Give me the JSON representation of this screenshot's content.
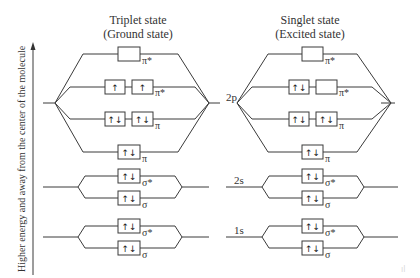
{
  "axis": {
    "label": "Higher energy and away from the center of the molecule"
  },
  "panels": [
    {
      "id": "triplet",
      "title_line1": "Triplet state",
      "title_line2": "(Ground state)",
      "orbitals": {
        "pi_star_top": {
          "label": "π*",
          "boxes": [
            ""
          ]
        },
        "pi_star_pair": {
          "label": "π*",
          "boxes": [
            "↑",
            "↑"
          ]
        },
        "pi_pair": {
          "label": "π",
          "boxes": [
            "↑↓",
            "↑↓"
          ]
        },
        "pi_low": {
          "label": "π",
          "boxes": [
            "↑↓"
          ]
        },
        "sigma_star_2s": {
          "label": "σ*",
          "boxes": [
            "↑↓"
          ]
        },
        "sigma_2s": {
          "label": "σ",
          "boxes": [
            "↑↓"
          ]
        },
        "sigma_star_1s": {
          "label": "σ*",
          "boxes": [
            "↑↓"
          ]
        },
        "sigma_1s": {
          "label": "σ",
          "boxes": [
            "↑↓"
          ]
        }
      }
    },
    {
      "id": "singlet",
      "title_line1": "Singlet state",
      "title_line2": "(Excited state)",
      "orbitals": {
        "pi_star_top": {
          "label": "π*",
          "boxes": [
            ""
          ]
        },
        "pi_star_pair": {
          "label": "π*",
          "boxes": [
            "↑↓",
            ""
          ]
        },
        "pi_pair": {
          "label": "π",
          "boxes": [
            "↑↓",
            "↑↓"
          ]
        },
        "pi_low": {
          "label": "π",
          "boxes": [
            "↑↓"
          ]
        },
        "sigma_star_2s": {
          "label": "σ*",
          "boxes": [
            "↑↓"
          ]
        },
        "sigma_2s": {
          "label": "σ",
          "boxes": [
            "↑↓"
          ]
        },
        "sigma_star_1s": {
          "label": "σ*",
          "boxes": [
            "↑↓"
          ]
        },
        "sigma_1s": {
          "label": "σ",
          "boxes": [
            "↑↓"
          ]
        }
      }
    }
  ],
  "atomic_labels": {
    "p2": "2p",
    "s2": "2s",
    "s1": "1s"
  },
  "watermark": "ıl"
}
